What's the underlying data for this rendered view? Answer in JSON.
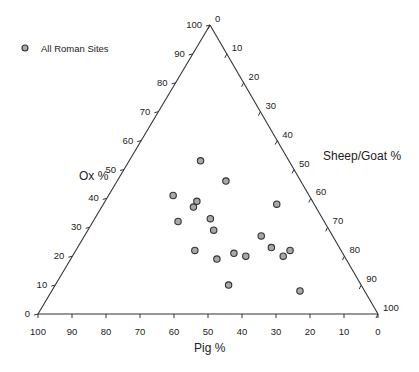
{
  "chart_data": {
    "type": "scatter",
    "subtype": "ternary",
    "title": "",
    "axes": {
      "bottom": {
        "label": "Pig %",
        "ticks": [
          100,
          90,
          80,
          70,
          60,
          50,
          40,
          30,
          20,
          10,
          0
        ]
      },
      "left": {
        "label": "Ox %",
        "ticks": [
          0,
          10,
          20,
          30,
          40,
          50,
          60,
          70,
          80,
          90,
          100
        ]
      },
      "right": {
        "label": "Sheep/Goat %",
        "ticks": [
          0,
          10,
          20,
          30,
          40,
          50,
          60,
          70,
          80,
          90,
          100
        ]
      }
    },
    "range": [
      0,
      100
    ],
    "grid": false,
    "legend": {
      "position": "top-left",
      "entries": [
        "All Roman Sites"
      ]
    },
    "series": [
      {
        "name": "All Roman Sites",
        "points": [
          {
            "pig": 26,
            "ox": 53,
            "sheep_goat": 21
          },
          {
            "pig": 22,
            "ox": 46,
            "sheep_goat": 32
          },
          {
            "pig": 40,
            "ox": 41,
            "sheep_goat": 19
          },
          {
            "pig": 34,
            "ox": 39,
            "sheep_goat": 27
          },
          {
            "pig": 36,
            "ox": 37,
            "sheep_goat": 27
          },
          {
            "pig": 11,
            "ox": 38,
            "sheep_goat": 51
          },
          {
            "pig": 43,
            "ox": 32,
            "sheep_goat": 25
          },
          {
            "pig": 33,
            "ox": 33,
            "sheep_goat": 34
          },
          {
            "pig": 34,
            "ox": 29,
            "sheep_goat": 37
          },
          {
            "pig": 21,
            "ox": 27,
            "sheep_goat": 52
          },
          {
            "pig": 43,
            "ox": 22,
            "sheep_goat": 35
          },
          {
            "pig": 38,
            "ox": 19,
            "sheep_goat": 43
          },
          {
            "pig": 32,
            "ox": 21,
            "sheep_goat": 47
          },
          {
            "pig": 29,
            "ox": 20,
            "sheep_goat": 51
          },
          {
            "pig": 20,
            "ox": 23,
            "sheep_goat": 57
          },
          {
            "pig": 18,
            "ox": 20,
            "sheep_goat": 62
          },
          {
            "pig": 15,
            "ox": 22,
            "sheep_goat": 63
          },
          {
            "pig": 39,
            "ox": 10,
            "sheep_goat": 51
          },
          {
            "pig": 19,
            "ox": 8,
            "sheep_goat": 73
          }
        ]
      }
    ]
  },
  "colors": {
    "point_fill": "#a8a8a8",
    "point_stroke": "#333333",
    "axis": "#333333"
  }
}
